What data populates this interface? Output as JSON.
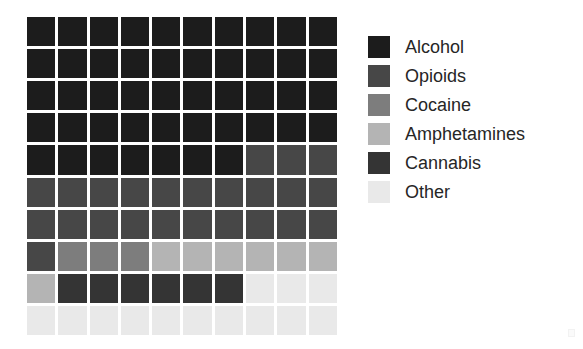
{
  "chart_data": {
    "type": "waffle",
    "title": "",
    "subtitle": "",
    "xlabel": "",
    "ylabel": "",
    "grid": false,
    "legend_position": "right",
    "rows": 10,
    "columns": 10,
    "total_cells": 100,
    "cell_unit": "1 cell = 1%",
    "fill_order": "left-to-right, top-to-bottom",
    "categories": [
      "Alcohol",
      "Opioids",
      "Cocaine",
      "Amphetamines",
      "Cannabis",
      "Other"
    ],
    "values": [
      47,
      24,
      3,
      7,
      6,
      13
    ],
    "percentages": [
      47,
      24,
      3,
      7,
      6,
      13
    ],
    "colors": [
      "#1c1c1c",
      "#474747",
      "#7d7d7d",
      "#b4b4b4",
      "#343434",
      "#e9e9e9"
    ],
    "cell_grid": [
      [
        0,
        0,
        0,
        0,
        0,
        0,
        0,
        0,
        0,
        0
      ],
      [
        0,
        0,
        0,
        0,
        0,
        0,
        0,
        0,
        0,
        0
      ],
      [
        0,
        0,
        0,
        0,
        0,
        0,
        0,
        0,
        0,
        0
      ],
      [
        0,
        0,
        0,
        0,
        0,
        0,
        0,
        0,
        0,
        0
      ],
      [
        0,
        0,
        0,
        0,
        0,
        0,
        0,
        1,
        1,
        1
      ],
      [
        1,
        1,
        1,
        1,
        1,
        1,
        1,
        1,
        1,
        1
      ],
      [
        1,
        1,
        1,
        1,
        1,
        1,
        1,
        1,
        1,
        1
      ],
      [
        1,
        2,
        2,
        2,
        3,
        3,
        3,
        3,
        3,
        3
      ],
      [
        3,
        4,
        4,
        4,
        4,
        4,
        4,
        5,
        5,
        5
      ],
      [
        5,
        5,
        5,
        5,
        5,
        5,
        5,
        5,
        5,
        5
      ]
    ]
  },
  "legend": {
    "items": [
      {
        "label": "Alcohol",
        "color": "#1c1c1c",
        "value": 47,
        "swatch_name": "legend-swatch-alcohol"
      },
      {
        "label": "Opioids",
        "color": "#474747",
        "value": 24,
        "swatch_name": "legend-swatch-opioids"
      },
      {
        "label": "Cocaine",
        "color": "#7d7d7d",
        "value": 3,
        "swatch_name": "legend-swatch-cocaine"
      },
      {
        "label": "Amphetamines",
        "color": "#b4b4b4",
        "value": 7,
        "swatch_name": "legend-swatch-amphetamines"
      },
      {
        "label": "Cannabis",
        "color": "#343434",
        "value": 6,
        "swatch_name": "legend-swatch-cannabis"
      },
      {
        "label": "Other",
        "color": "#e9e9e9",
        "value": 13,
        "swatch_name": "legend-swatch-other"
      }
    ]
  }
}
